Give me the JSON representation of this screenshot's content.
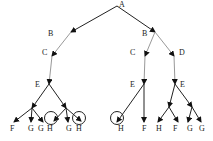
{
  "diagram": {
    "type": "tree",
    "nodes": [
      {
        "id": "A",
        "label": "A",
        "x": 117,
        "y": 6,
        "lx": 119,
        "ly": 7
      },
      {
        "id": "B1",
        "label": "B",
        "x": 71,
        "y": 32,
        "lx": 48,
        "ly": 36
      },
      {
        "id": "B2",
        "label": "B",
        "x": 155,
        "y": 32,
        "lx": 142,
        "ly": 36
      },
      {
        "id": "C1",
        "label": "C",
        "x": 52,
        "y": 56,
        "lx": 42,
        "ly": 55
      },
      {
        "id": "C2",
        "label": "C",
        "x": 145,
        "y": 56,
        "lx": 130,
        "ly": 55
      },
      {
        "id": "D",
        "label": "D",
        "x": 174,
        "y": 56,
        "lx": 179,
        "ly": 55
      },
      {
        "id": "E1",
        "label": "E",
        "x": 49,
        "y": 84,
        "lx": 35,
        "ly": 87
      },
      {
        "id": "E2",
        "label": "E",
        "x": 144,
        "y": 84,
        "lx": 130,
        "ly": 87
      },
      {
        "id": "E3",
        "label": "E",
        "x": 175,
        "y": 84,
        "lx": 180,
        "ly": 87
      },
      {
        "id": "n1",
        "label": "",
        "x": 32,
        "y": 108
      },
      {
        "id": "n2",
        "label": "",
        "x": 66,
        "y": 108
      },
      {
        "id": "n3",
        "label": "",
        "x": 169,
        "y": 107
      },
      {
        "id": "n4",
        "label": "",
        "x": 192,
        "y": 107
      },
      {
        "id": "L1",
        "label": "F",
        "x": 14,
        "y": 122,
        "lx": 10,
        "ly": 131
      },
      {
        "id": "L2",
        "label": "G",
        "x": 31,
        "y": 122,
        "lx": 28,
        "ly": 131
      },
      {
        "id": "L3",
        "label": "G",
        "x": 43,
        "y": 122,
        "lx": 38,
        "ly": 131
      },
      {
        "id": "L4",
        "label": "H",
        "x": 54,
        "y": 121,
        "lx": 47,
        "ly": 131,
        "circled": true,
        "cx": 51,
        "cy": 118
      },
      {
        "id": "L5",
        "label": "G",
        "x": 68,
        "y": 122,
        "lx": 66,
        "ly": 131
      },
      {
        "id": "L6",
        "label": "H",
        "x": 81,
        "y": 121,
        "lx": 76,
        "ly": 131,
        "circled": true,
        "cx": 79,
        "cy": 118
      },
      {
        "id": "L7",
        "label": "H",
        "x": 117,
        "y": 122,
        "lx": 118,
        "ly": 131,
        "circled": true,
        "cx": 117,
        "cy": 118
      },
      {
        "id": "L8",
        "label": "F",
        "x": 144,
        "y": 122,
        "lx": 142,
        "ly": 131
      },
      {
        "id": "L9",
        "label": "H",
        "x": 158,
        "y": 122,
        "lx": 156,
        "ly": 131
      },
      {
        "id": "L10",
        "label": "F",
        "x": 178,
        "y": 122,
        "lx": 173,
        "ly": 131
      },
      {
        "id": "L11",
        "label": "G",
        "x": 188,
        "y": 122,
        "lx": 187,
        "ly": 131
      },
      {
        "id": "L12",
        "label": "G",
        "x": 201,
        "y": 122,
        "lx": 199,
        "ly": 131
      }
    ],
    "edges": [
      {
        "from": "A",
        "to": "B1",
        "style": "dark"
      },
      {
        "from": "A",
        "to": "B2",
        "style": "dark"
      },
      {
        "from": "B1",
        "to": "C1",
        "style": "light"
      },
      {
        "from": "B2",
        "to": "C2",
        "style": "light"
      },
      {
        "from": "B2",
        "to": "D",
        "style": "light"
      },
      {
        "from": "C1",
        "to": "E1",
        "style": "light"
      },
      {
        "from": "C2",
        "to": "E2",
        "style": "light"
      },
      {
        "from": "D",
        "to": "E3",
        "style": "light"
      },
      {
        "from": "E1",
        "to": "n1",
        "style": "dark"
      },
      {
        "from": "E1",
        "to": "n2",
        "style": "dark"
      },
      {
        "from": "n1",
        "to": "L1",
        "style": "dark"
      },
      {
        "from": "n1",
        "to": "L2",
        "style": "dark"
      },
      {
        "from": "n1",
        "to": "L3",
        "style": "dark"
      },
      {
        "from": "n2",
        "to": "L4",
        "style": "dark"
      },
      {
        "from": "n2",
        "to": "L5",
        "style": "dark"
      },
      {
        "from": "n2",
        "to": "L6",
        "style": "dark"
      },
      {
        "from": "E2",
        "to": "L7",
        "style": "dark"
      },
      {
        "from": "E2",
        "to": "L8",
        "style": "dark"
      },
      {
        "from": "E3",
        "to": "n3",
        "style": "dark"
      },
      {
        "from": "E3",
        "to": "n4",
        "style": "dark"
      },
      {
        "from": "n3",
        "to": "L9",
        "style": "dark"
      },
      {
        "from": "n3",
        "to": "L10",
        "style": "dark"
      },
      {
        "from": "n4",
        "to": "L11",
        "style": "dark"
      },
      {
        "from": "n4",
        "to": "L12",
        "style": "dark"
      }
    ]
  }
}
